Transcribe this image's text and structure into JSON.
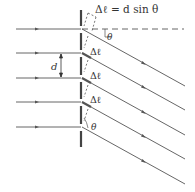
{
  "diagram": {
    "title_formula": "Δℓ = d sin θ",
    "labels": {
      "d": "d",
      "theta_top": "θ",
      "theta_bottom": "θ",
      "delta_l_1": "Δℓ",
      "delta_l_2": "Δℓ",
      "delta_l_3": "Δℓ"
    },
    "colors": {
      "ray": "#555555",
      "barrier": "#444444",
      "text": "#333333",
      "background": "#ffffff"
    },
    "slits": [
      29,
      53,
      78,
      102,
      127
    ],
    "barrier_x": 81,
    "angle_deg": 28
  }
}
